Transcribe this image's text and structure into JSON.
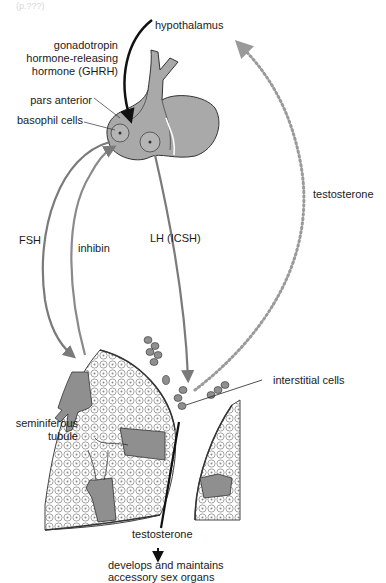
{
  "figure": {
    "corner_note": "(p.???)",
    "labels": {
      "hypothalamus": "hypothalamus",
      "ghrh_line1": "gonadotropin",
      "ghrh_line2": "hormone-releasing",
      "ghrh_line3": "hormone (GHRH)",
      "pars_anterior": "pars anterior",
      "basophil_cells": "basophil cells",
      "fsh": "FSH",
      "inhibin": "inhibin",
      "lh": "LH (ICSH)",
      "testosterone_feedback": "testosterone",
      "interstitial_cells": "interstitial cells",
      "seminiferous_line1": "seminiferous",
      "seminiferous_line2": "tubule",
      "testosterone_output": "testosterone",
      "effect_line1": "develops and maintains",
      "effect_line2": "accessory sex organs"
    },
    "colors": {
      "gland_fill": "#a9a9a9",
      "cell_fill": "#8f8f8f",
      "arrow_gray": "#7a7a7a",
      "arrow_black": "#111111",
      "dotted": "#9a9a9a"
    }
  }
}
